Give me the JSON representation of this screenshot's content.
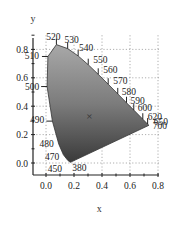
{
  "chart_data": {
    "type": "scatter",
    "title": "",
    "xlabel": "x",
    "ylabel": "y",
    "xlim": [
      -0.05,
      0.8
    ],
    "ylim": [
      -0.05,
      0.88
    ],
    "xticks": [
      "0.0",
      "0.2",
      "0.4",
      "0.6",
      "0.8"
    ],
    "yticks": [
      "0.0",
      "0.2",
      "0.4",
      "0.6",
      "0.8"
    ],
    "xtick_values": [
      0.0,
      0.2,
      0.4,
      0.6,
      0.8
    ],
    "ytick_values": [
      0.0,
      0.2,
      0.4,
      0.6,
      0.8
    ],
    "grid": true,
    "spectral_locus": [
      {
        "nm": 380,
        "x": 0.1741,
        "y": 0.005
      },
      {
        "nm": 450,
        "x": 0.1566,
        "y": 0.0177
      },
      {
        "nm": 470,
        "x": 0.1241,
        "y": 0.0578
      },
      {
        "nm": 480,
        "x": 0.0913,
        "y": 0.1327
      },
      {
        "nm": 490,
        "x": 0.0454,
        "y": 0.295
      },
      {
        "nm": 500,
        "x": 0.0082,
        "y": 0.5384
      },
      {
        "nm": 510,
        "x": 0.0139,
        "y": 0.7502
      },
      {
        "nm": 520,
        "x": 0.0743,
        "y": 0.8338
      },
      {
        "nm": 530,
        "x": 0.1547,
        "y": 0.8059
      },
      {
        "nm": 540,
        "x": 0.2296,
        "y": 0.7543
      },
      {
        "nm": 550,
        "x": 0.3016,
        "y": 0.6923
      },
      {
        "nm": 560,
        "x": 0.3731,
        "y": 0.6245
      },
      {
        "nm": 570,
        "x": 0.4441,
        "y": 0.5547
      },
      {
        "nm": 580,
        "x": 0.5125,
        "y": 0.4866
      },
      {
        "nm": 590,
        "x": 0.5752,
        "y": 0.4242
      },
      {
        "nm": 600,
        "x": 0.627,
        "y": 0.3725
      },
      {
        "nm": 620,
        "x": 0.6915,
        "y": 0.3083
      },
      {
        "nm": 650,
        "x": 0.726,
        "y": 0.274
      },
      {
        "nm": 700,
        "x": 0.7347,
        "y": 0.2653
      }
    ],
    "labeled_wavelengths": [
      "450",
      "470",
      "480",
      "490",
      "500",
      "510",
      "520",
      "530",
      "540",
      "550",
      "560",
      "570",
      "580",
      "590",
      "600",
      "620",
      "650",
      "700",
      "380"
    ],
    "white_point": {
      "label": "×",
      "x": 0.31,
      "y": 0.33
    }
  }
}
